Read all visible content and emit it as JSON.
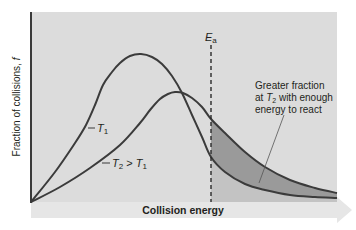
{
  "chart_data": {
    "type": "line",
    "title": "",
    "xlabel": "Collision energy",
    "ylabel": "Fraction of collisions, f",
    "ylabel_parts": {
      "text": "Fraction of collisions, ",
      "var": "f"
    },
    "grid": false,
    "legend": "none (inline curve labels)",
    "x_range_px": [
      31,
      337
    ],
    "y_range_px": [
      202,
      12
    ],
    "series": [
      {
        "name": "T1",
        "label": "T",
        "label_sub": "1",
        "points": [
          [
            31,
            202
          ],
          [
            55,
            172
          ],
          [
            75,
            143
          ],
          [
            86,
            125
          ],
          [
            95,
            105
          ],
          [
            103,
            85
          ],
          [
            112,
            72
          ],
          [
            120,
            63
          ],
          [
            130,
            56
          ],
          [
            141,
            54
          ],
          [
            152,
            57
          ],
          [
            162,
            64
          ],
          [
            172,
            76
          ],
          [
            182,
            93
          ],
          [
            192,
            115
          ],
          [
            202,
            137
          ],
          [
            211,
            157
          ],
          [
            225,
            172
          ],
          [
            245,
            184
          ],
          [
            265,
            190
          ],
          [
            290,
            195
          ],
          [
            315,
            197
          ],
          [
            337,
            198
          ]
        ]
      },
      {
        "name": "T2 > T1",
        "label": "T",
        "label_sub": "2",
        "label_rest": " > ",
        "label_rest2": "T",
        "label_rest2_sub": "1",
        "points": [
          [
            31,
            202
          ],
          [
            60,
            187
          ],
          [
            90,
            168
          ],
          [
            120,
            145
          ],
          [
            140,
            123
          ],
          [
            150,
            110
          ],
          [
            160,
            99
          ],
          [
            168,
            94
          ],
          [
            175,
            92
          ],
          [
            183,
            93
          ],
          [
            192,
            98
          ],
          [
            202,
            107
          ],
          [
            211,
            119
          ],
          [
            225,
            133
          ],
          [
            245,
            152
          ],
          [
            265,
            167
          ],
          [
            290,
            180
          ],
          [
            315,
            188
          ],
          [
            337,
            193
          ]
        ]
      }
    ],
    "annotations": {
      "ea_label": "E",
      "ea_sub": "a",
      "ea_x": 211,
      "callout_lines": [
        "Greater fraction",
        "at T2 with enough",
        "energy to react"
      ],
      "callout_line1": "Greater fraction",
      "callout_line2_pre": "at ",
      "callout_line2_var": "T",
      "callout_line2_sub": "2",
      "callout_line2_post": " with enough",
      "callout_line3": "energy to react"
    }
  },
  "colors": {
    "panel": "#dcdcdc",
    "axis": "#3a3a3a",
    "curve": "#3b3b3b",
    "shade_dark": "#9a9a9a",
    "shade_light": "#c3c3c3",
    "arrow_band": "#e6e6e6"
  }
}
